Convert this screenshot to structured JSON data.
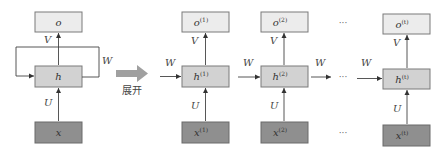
{
  "diagram": {
    "type": "rnn-unrolling",
    "colors": {
      "output_box": "#ececec",
      "hidden_box": "#d2d2d2",
      "input_box": "#8f8f8f",
      "unfold_arrow": "#a0a0a0",
      "line": "#444444"
    },
    "folded": {
      "output": "o",
      "hidden": "h",
      "input": "x",
      "weight_V": "V",
      "weight_U": "U",
      "weight_W": "W"
    },
    "unfold_label": "展开",
    "steps": [
      {
        "output": "o",
        "hidden": "h",
        "input": "x",
        "sup": "(1)",
        "V": "V",
        "U": "U",
        "W_in": "W"
      },
      {
        "output": "o",
        "hidden": "h",
        "input": "x",
        "sup": "(2)",
        "V": "V",
        "U": "U",
        "W_in": "W"
      },
      {
        "output": "o",
        "hidden": "h",
        "input": "x",
        "sup": "(t)",
        "V": "V",
        "U": "U",
        "W_in": "W"
      }
    ],
    "between_W": "W",
    "ellipsis": "···"
  }
}
